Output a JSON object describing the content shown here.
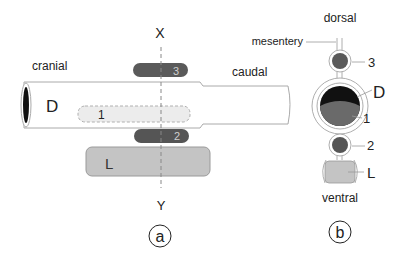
{
  "panel_a": {
    "axis_top": "X",
    "axis_bottom": "Y",
    "label_cranial": "cranial",
    "label_caudal": "caudal",
    "tube_label": "D",
    "inner_label_1": "1",
    "bar_3_label": "3",
    "bar_2_label": "2",
    "box_L_label": "L",
    "panel_tag": "a"
  },
  "panel_b": {
    "label_dorsal": "dorsal",
    "label_mesentery": "mesentery",
    "label_3": "3",
    "label_D": "D",
    "label_1": "1",
    "label_2": "2",
    "label_L": "L",
    "label_ventral": "ventral",
    "panel_tag": "b"
  },
  "colors": {
    "dark_gray": "#555555",
    "mid_gray": "#6a6a6a",
    "light_gray": "#c8c8c8",
    "pale_gray": "#e6e6e6",
    "black": "#111111",
    "outline": "#999999"
  }
}
